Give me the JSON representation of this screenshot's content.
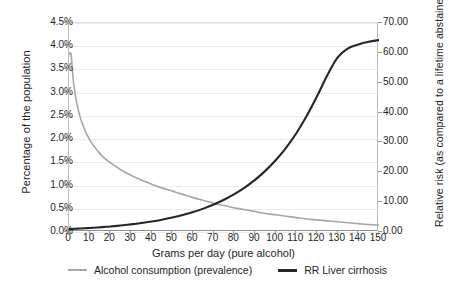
{
  "chart_data": {
    "type": "line",
    "title": "",
    "xlabel": "Grams per day (pure alcohol)",
    "ylabel": "Percentage of the population",
    "ylabel_secondary": "Relative risk (as compared to a lifetime abstainer)",
    "xlim": [
      0,
      150
    ],
    "ylim": [
      0,
      4.5
    ],
    "ylim_secondary": [
      0,
      70
    ],
    "xticks": [
      0,
      10,
      20,
      30,
      40,
      50,
      60,
      70,
      80,
      90,
      100,
      110,
      120,
      130,
      140,
      150
    ],
    "xticklabels": [
      "0",
      "10",
      "20",
      "30",
      "40",
      "50",
      "60",
      "70",
      "80",
      "90",
      "100",
      "110",
      "120",
      "130",
      "140",
      "150"
    ],
    "yticks": [
      0.0,
      0.5,
      1.0,
      1.5,
      2.0,
      2.5,
      3.0,
      3.5,
      4.0,
      4.5
    ],
    "yticklabels": [
      "0.0%",
      "0.5%",
      "1.0%",
      "1.5%",
      "2.0%",
      "2.5%",
      "3.0%",
      "3.5%",
      "4.0%",
      "4.5%"
    ],
    "yticks_secondary": [
      0,
      10,
      20,
      30,
      40,
      50,
      60,
      70
    ],
    "yticklabels_secondary": [
      "0.00",
      "10.00",
      "20.00",
      "30.00",
      "40.00",
      "50.00",
      "60.00",
      "70.00"
    ],
    "grid": "horizontal",
    "legend_position": "bottom",
    "x": [
      0,
      1,
      2,
      3,
      4,
      5,
      6,
      8,
      10,
      12,
      14,
      16,
      18,
      20,
      25,
      30,
      35,
      40,
      45,
      50,
      55,
      60,
      65,
      70,
      75,
      80,
      85,
      90,
      95,
      100,
      105,
      110,
      115,
      120,
      125,
      130,
      135,
      140,
      145,
      150
    ],
    "series": [
      {
        "name": "Alcohol consumption (prevalence)",
        "axis": "left",
        "unit": "%",
        "color": "#a6a6a6",
        "values": [
          3.82,
          3.82,
          3.3,
          2.96,
          2.72,
          2.54,
          2.39,
          2.16,
          1.99,
          1.85,
          1.74,
          1.64,
          1.56,
          1.49,
          1.34,
          1.22,
          1.12,
          1.03,
          0.95,
          0.88,
          0.81,
          0.74,
          0.68,
          0.62,
          0.57,
          0.52,
          0.48,
          0.44,
          0.4,
          0.37,
          0.34,
          0.31,
          0.28,
          0.26,
          0.24,
          0.22,
          0.2,
          0.18,
          0.16,
          0.15
        ]
      },
      {
        "name": "RR Liver cirrhosis",
        "axis": "right",
        "unit": "",
        "color": "#262626",
        "values": [
          1.0,
          1.03,
          1.06,
          1.09,
          1.12,
          1.16,
          1.19,
          1.27,
          1.35,
          1.44,
          1.53,
          1.63,
          1.74,
          1.85,
          2.17,
          2.55,
          2.99,
          3.51,
          4.12,
          4.84,
          5.68,
          6.67,
          7.83,
          9.19,
          10.79,
          12.66,
          14.86,
          17.44,
          20.47,
          24.02,
          28.19,
          33.09,
          38.82,
          45.44,
          52.5,
          58.5,
          61.5,
          62.8,
          63.7,
          64.3
        ]
      }
    ]
  },
  "legend": {
    "items": [
      {
        "label": "Alcohol consumption (prevalence)",
        "color": "#a6a6a6"
      },
      {
        "label": "RR Liver cirrhosis",
        "color": "#262626"
      }
    ]
  }
}
